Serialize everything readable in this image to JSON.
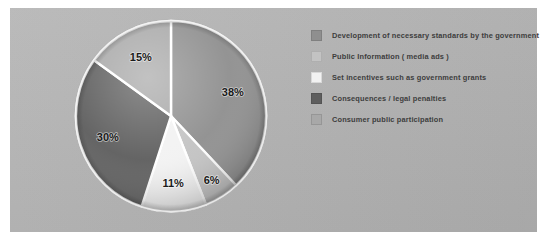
{
  "figure": {
    "background_color": "#ffffff",
    "panel_color": "#b4b4b4"
  },
  "chart_data": {
    "type": "pie",
    "title": "",
    "categories": [
      "Development of necessary standards by the government",
      "Public Information ( media ads )",
      "Set incentives such as government grants",
      "Consequences / legal penalties",
      "Consumer public participation"
    ],
    "values": [
      38,
      6,
      11,
      30,
      15
    ],
    "value_labels": [
      "38%",
      "6%",
      "11%",
      "30%",
      "15%"
    ],
    "unit": "%",
    "colors": [
      "#8f8f8f",
      "#c3c3c3",
      "#f2f2f2",
      "#5e5e5e",
      "#a8a8a8"
    ],
    "start_angle_deg": 90,
    "direction": "clockwise",
    "legend_position": "right",
    "grid": false,
    "slice_label_color": "#1a1a1a",
    "separator_color": "#ffffff"
  },
  "legend": {
    "items": [
      {
        "label": "Development of necessary standards by the government",
        "color": "#8f8f8f"
      },
      {
        "label": "Public Information ( media ads )",
        "color": "#c3c3c3"
      },
      {
        "label": "Set incentives such as government grants",
        "color": "#f2f2f2"
      },
      {
        "label": "Consequences / legal penalties",
        "color": "#5e5e5e"
      },
      {
        "label": "Consumer public participation",
        "color": "#a8a8a8"
      }
    ]
  }
}
